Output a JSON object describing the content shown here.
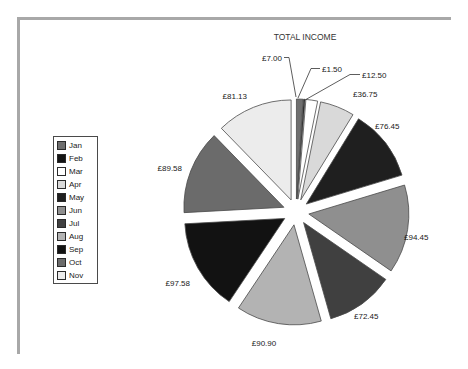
{
  "frame": {
    "color": "#a8a8a8"
  },
  "chart_data": {
    "type": "pie",
    "title": "TOTAL INCOME",
    "categories": [
      "Jan",
      "Feb",
      "Mar",
      "Apr",
      "May",
      "Jun",
      "Jul",
      "Aug",
      "Sep",
      "Oct",
      "Nov"
    ],
    "values": [
      7.0,
      1.5,
      12.5,
      36.75,
      76.45,
      94.45,
      72.45,
      90.9,
      97.58,
      89.58,
      81.13
    ],
    "data_labels": [
      "£7.00",
      "£1.50",
      "£12.50",
      "£36.75",
      "£76.45",
      "£94.45",
      "£72.45",
      "£90.90",
      "£97.58",
      "£89.58",
      "£81.13"
    ],
    "colors": [
      "#6e6e6e",
      "#141414",
      "#ffffff",
      "#d9d9d9",
      "#1f1f1f",
      "#8f8f8f",
      "#404040",
      "#b3b3b3",
      "#121212",
      "#6b6b6b",
      "#ececec"
    ],
    "currency": "£",
    "exploded": true,
    "start_angle_deg": 0,
    "direction": "clockwise",
    "legend_position": "left",
    "legend_border_color": "#4a4a4a",
    "slice_border_color": "#4a4a4a",
    "leader_line_color": "#333333",
    "label_color": "#1a1a1a",
    "title_color": "#333333"
  }
}
